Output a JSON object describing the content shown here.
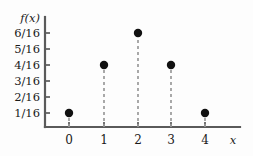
{
  "chart_data": {
    "type": "scatter",
    "subtype": "stem-plot",
    "title": "",
    "subtitle": "",
    "xlabel": "x",
    "ylabel": "f(x)",
    "x": [
      0,
      1,
      2,
      3,
      4
    ],
    "values": [
      0.0625,
      0.25,
      0.375,
      0.25,
      0.0625
    ],
    "value_labels": [
      "1/16",
      "4/16",
      "6/16",
      "4/16",
      "1/16"
    ],
    "categories": [
      "0",
      "1",
      "2",
      "3",
      "4"
    ],
    "series": [
      {
        "name": "f(x)",
        "values": [
          0.0625,
          0.25,
          0.375,
          0.25,
          0.0625
        ]
      }
    ],
    "xlim": [
      -0.45,
      5.1
    ],
    "ylim": [
      0,
      0.4375
    ],
    "xticks": [
      0,
      1,
      2,
      3,
      4
    ],
    "xticklabels": [
      "0",
      "1",
      "2",
      "3",
      "4"
    ],
    "yticks": [
      0.0625,
      0.125,
      0.1875,
      0.25,
      0.3125,
      0.375
    ],
    "yticklabels": [
      "1/16",
      "2/16",
      "3/16",
      "4/16",
      "5/16",
      "6/16"
    ],
    "grid": false,
    "legend": false,
    "legend_position": "none",
    "marker": "filled-circle",
    "stem_style": "dashed",
    "colors": {
      "axis": "#5a5a5a",
      "marker": "#111111",
      "stem": "#9a9a9a",
      "text": "#1a1a1a",
      "background": "#fdfdfd"
    },
    "points": [
      {
        "x": "0",
        "y_label": "1/16",
        "y": 0.0625
      },
      {
        "x": "1",
        "y_label": "4/16",
        "y": 0.25
      },
      {
        "x": "2",
        "y_label": "6/16",
        "y": 0.375
      },
      {
        "x": "3",
        "y_label": "4/16",
        "y": 0.25
      },
      {
        "x": "4",
        "y_label": "1/16",
        "y": 0.0625
      }
    ]
  },
  "geometry": {
    "axis_origin_x": 45,
    "axis_origin_y": 127,
    "axis_top_y": 17,
    "axis_right_x": 240,
    "x_pixels": [
      69,
      104,
      138,
      171,
      205
    ],
    "y_pixels_for_yticks": [
      113,
      97,
      81,
      65,
      49,
      33
    ],
    "y_pixels_for_points": [
      113,
      65,
      33,
      65,
      113
    ],
    "y_tick_label_x": 40,
    "x_tick_label_y": 144,
    "dot_radius": 4.2,
    "tick_len": 5,
    "ylabel_pos": {
      "x": 40,
      "y": 22
    },
    "xlabel_pos": {
      "x": 233,
      "y": 144
    }
  }
}
